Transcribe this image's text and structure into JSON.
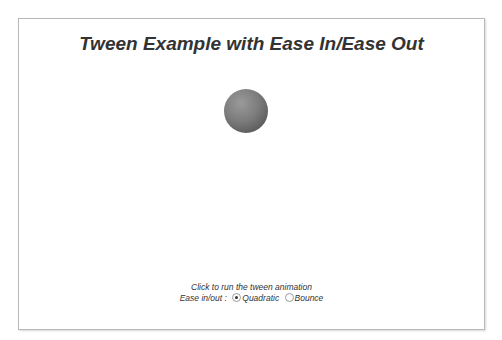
{
  "chart": {
    "title": "Tween Example with Ease In/Ease Out",
    "caption": "Click to run the tween animation",
    "ease_label": "Ease in/out :",
    "options": [
      {
        "label": "Quadratic",
        "selected": true
      },
      {
        "label": "Bounce",
        "selected": false
      }
    ],
    "ball_color": "#7c7c7c"
  }
}
